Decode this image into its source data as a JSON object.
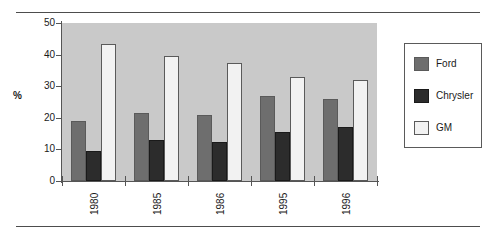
{
  "chart_data": {
    "type": "bar",
    "title": "",
    "subtitle": "",
    "xlabel": "",
    "ylabel": "%",
    "categories": [
      "1980",
      "1985",
      "1986",
      "1995",
      "1996"
    ],
    "series": [
      {
        "name": "Ford",
        "values": [
          19,
          21.5,
          21,
          27,
          26
        ],
        "color": "#6e6e6e"
      },
      {
        "name": "Chrysler",
        "values": [
          9.5,
          13,
          12.5,
          15.5,
          17
        ],
        "color": "#2c2c2c"
      },
      {
        "name": "GM",
        "values": [
          43.5,
          39.5,
          37.5,
          33,
          32
        ],
        "color": "#f2f2f2"
      }
    ],
    "ylim": [
      0,
      50
    ],
    "yticks": [
      "0",
      "10",
      "20",
      "30",
      "40",
      "50"
    ],
    "grid": false,
    "legend_position": "right",
    "plot_background": "#c9c9c9",
    "annotations": []
  },
  "legend": {
    "items": [
      {
        "label": "Ford"
      },
      {
        "label": "Chrysler"
      },
      {
        "label": "GM"
      }
    ]
  },
  "axis": {
    "y_label": "%",
    "y_ticks": [
      "50",
      "40",
      "30",
      "20",
      "10",
      "0"
    ],
    "x_ticks": [
      "1980",
      "1985",
      "1986",
      "1995",
      "1996"
    ]
  }
}
